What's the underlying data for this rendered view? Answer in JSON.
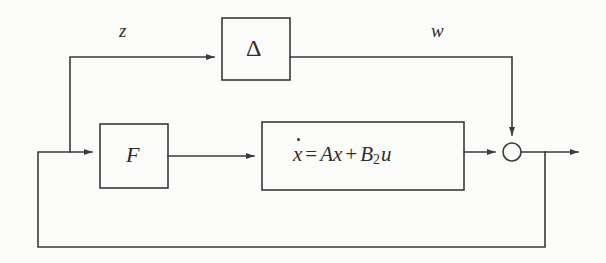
{
  "diagram": {
    "type": "control-block-diagram",
    "background_color": "#fbfbf9",
    "line_color": "#3a3a3a",
    "text_color": "#2e2e2e",
    "blocks": [
      {
        "id": "uncertainty",
        "label": "Δ",
        "name": "delta-block",
        "x": 222,
        "y": 18,
        "width": 68,
        "height": 62
      },
      {
        "id": "controller",
        "label": "F",
        "name": "f-block",
        "x": 100,
        "y": 124,
        "width": 68,
        "height": 64
      },
      {
        "id": "plant",
        "label": "ẋ = Ax + B₂u",
        "name": "plant-block",
        "equation": {
          "state_derivative": "x",
          "equals": "=",
          "a_term": "Ax",
          "plus": "+",
          "b_matrix": "B",
          "b_subscript": "2",
          "input": "u"
        },
        "x": 262,
        "y": 122,
        "width": 202,
        "height": 68
      }
    ],
    "junctions": [
      {
        "id": "summing-junction",
        "name": "summing-junction",
        "shape": "circle",
        "cx": 512,
        "cy": 152,
        "r": 9
      }
    ],
    "signals": [
      {
        "id": "z-signal",
        "label": "z",
        "name": "signal-label-z",
        "x": 125,
        "y": 32,
        "description": "performance output routed to uncertainty block"
      },
      {
        "id": "w-signal",
        "label": "w",
        "name": "signal-label-w",
        "x": 438,
        "y": 32,
        "description": "uncertainty output fed into summing junction"
      }
    ],
    "paths": [
      {
        "name": "z-path",
        "description": "from main line tap up and right into Delta block input"
      },
      {
        "name": "w-path",
        "description": "from Delta block output right then down into summing junction"
      },
      {
        "name": "f-to-plant-path",
        "description": "from F block output to plant block input"
      },
      {
        "name": "plant-to-sum-path",
        "description": "from plant block output to summing junction"
      },
      {
        "name": "output-path",
        "description": "from summing junction to right edge output arrow"
      },
      {
        "name": "outer-feedback-path",
        "description": "from output tap down, left along bottom, up and right into F block input"
      }
    ]
  }
}
